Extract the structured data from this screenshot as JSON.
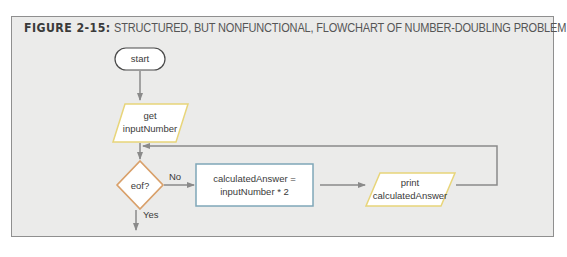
{
  "figure": {
    "label": "FIGURE 2-15:",
    "title": "STRUCTURED, BUT NONFUNCTIONAL, FLOWCHART OF NUMBER-DOUBLING PROBLEM"
  },
  "flowchart": {
    "nodes": [
      {
        "id": "start",
        "shape": "terminator",
        "lines": [
          "start"
        ]
      },
      {
        "id": "input",
        "shape": "parallelogram",
        "lines": [
          "get",
          "inputNumber"
        ]
      },
      {
        "id": "decision",
        "shape": "diamond",
        "lines": [
          "eof?"
        ]
      },
      {
        "id": "process",
        "shape": "rectangle",
        "lines": [
          "calculatedAnswer =",
          "inputNumber * 2"
        ]
      },
      {
        "id": "output",
        "shape": "parallelogram",
        "lines": [
          "print",
          "calculatedAnswer"
        ]
      }
    ],
    "edges": [
      {
        "from": "start",
        "to": "input"
      },
      {
        "from": "input",
        "to": "decision"
      },
      {
        "from": "decision",
        "to": "process",
        "label": "No"
      },
      {
        "from": "process",
        "to": "output"
      },
      {
        "from": "output",
        "to": "decision",
        "label": "loop back"
      },
      {
        "from": "decision",
        "to": "exit",
        "label": "Yes"
      }
    ],
    "labels": {
      "no": "No",
      "yes": "Yes"
    }
  },
  "colors": {
    "background": "#ebebea",
    "frame_border": "#8f8f8f",
    "arrow": "#8a8a8a",
    "io_border": "#e8d57a",
    "decision_border": "#d9a06a",
    "process_border": "#7fa7b8",
    "shape_fill": "#ffffff"
  }
}
